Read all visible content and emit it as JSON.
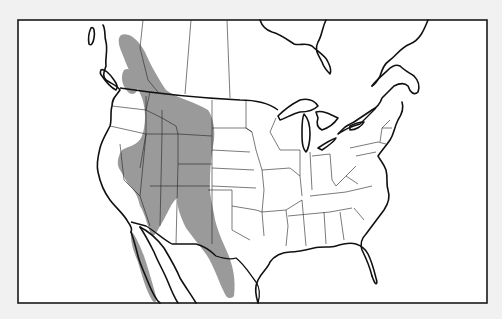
{
  "map": {
    "title": "Range map of North America",
    "subject": "Shaded species range across western North America",
    "region": "North America (Canada, United States, Mexico)",
    "legend": [],
    "colors": {
      "background": "#f1f1f1",
      "land": "#ffffff",
      "range_fill": "#9a9a9a",
      "lines": "#111111"
    },
    "range_description": "Western range from British Columbia through the Rocky Mountains and Great Basin into the Sierra Madre Occidental of Mexico, plus Baja California"
  }
}
